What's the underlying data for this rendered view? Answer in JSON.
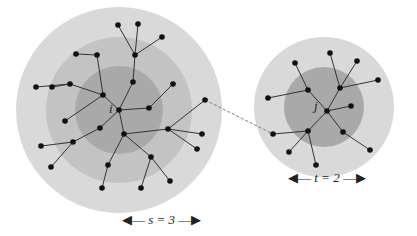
{
  "colors": {
    "outer": "#d9d9d9",
    "middle": "#c3c3c3",
    "inner": "#a9a9a9",
    "node": "#111111",
    "edge": "#333333"
  },
  "left": {
    "label": "i",
    "center": [
      119,
      110
    ],
    "rings": [
      103,
      73,
      44
    ],
    "nodes": [
      [
        119,
        110
      ],
      [
        103,
        95
      ],
      [
        133,
        82
      ],
      [
        70,
        84
      ],
      [
        97,
        55
      ],
      [
        76,
        54
      ],
      [
        52,
        87
      ],
      [
        36,
        87
      ],
      [
        118,
        25
      ],
      [
        138,
        24
      ],
      [
        135,
        55
      ],
      [
        162,
        37
      ],
      [
        149,
        108
      ],
      [
        173,
        84
      ],
      [
        65,
        121
      ],
      [
        100,
        128
      ],
      [
        124,
        134
      ],
      [
        73,
        142
      ],
      [
        41,
        146
      ],
      [
        51,
        167
      ],
      [
        168,
        129
      ],
      [
        202,
        134
      ],
      [
        197,
        149
      ],
      [
        205,
        100
      ],
      [
        151,
        157
      ],
      [
        108,
        165
      ],
      [
        102,
        188
      ],
      [
        141,
        188
      ],
      [
        170,
        181
      ]
    ],
    "edges": [
      [
        0,
        1
      ],
      [
        0,
        2
      ],
      [
        2,
        10
      ],
      [
        10,
        8
      ],
      [
        10,
        9
      ],
      [
        10,
        11
      ],
      [
        1,
        3
      ],
      [
        1,
        4
      ],
      [
        4,
        5
      ],
      [
        3,
        6
      ],
      [
        3,
        7
      ],
      [
        0,
        12
      ],
      [
        12,
        13
      ],
      [
        1,
        14
      ],
      [
        0,
        15
      ],
      [
        0,
        16
      ],
      [
        15,
        17
      ],
      [
        17,
        18
      ],
      [
        17,
        19
      ],
      [
        16,
        20
      ],
      [
        20,
        21
      ],
      [
        20,
        22
      ],
      [
        20,
        23
      ],
      [
        16,
        24
      ],
      [
        16,
        25
      ],
      [
        25,
        26
      ],
      [
        24,
        27
      ],
      [
        24,
        28
      ]
    ]
  },
  "right": {
    "label": "j",
    "center": [
      324,
      107
    ],
    "rings": [
      70,
      40
    ],
    "nodes": [
      [
        327,
        111
      ],
      [
        308,
        90
      ],
      [
        340,
        88
      ],
      [
        295,
        63
      ],
      [
        330,
        53
      ],
      [
        357,
        61
      ],
      [
        378,
        80
      ],
      [
        268,
        98
      ],
      [
        351,
        106
      ],
      [
        308,
        131
      ],
      [
        273,
        134
      ],
      [
        289,
        152
      ],
      [
        316,
        165
      ],
      [
        343,
        132
      ],
      [
        370,
        150
      ]
    ],
    "edges": [
      [
        0,
        1
      ],
      [
        1,
        3
      ],
      [
        1,
        7
      ],
      [
        0,
        2
      ],
      [
        2,
        4
      ],
      [
        2,
        5
      ],
      [
        2,
        6
      ],
      [
        0,
        8
      ],
      [
        0,
        9
      ],
      [
        9,
        10
      ],
      [
        9,
        11
      ],
      [
        9,
        12
      ],
      [
        0,
        13
      ],
      [
        13,
        14
      ]
    ]
  },
  "link": {
    "from": [
      205,
      100
    ],
    "to": [
      273,
      134
    ]
  },
  "captions": {
    "s": {
      "var": "s",
      "value": "3",
      "text": "s = 3"
    },
    "t": {
      "var": "t",
      "value": "2",
      "text": "t = 2"
    }
  }
}
